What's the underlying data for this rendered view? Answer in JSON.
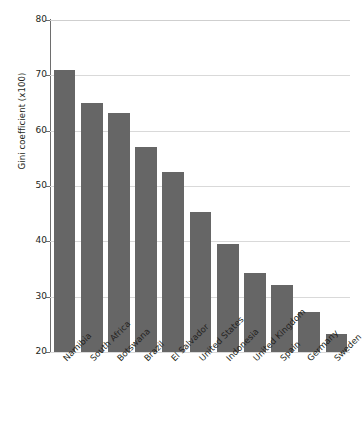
{
  "chart_data": {
    "type": "bar",
    "title": "",
    "xlabel": "",
    "ylabel": "Gini coefficient (x100)",
    "ylim": [
      20,
      80
    ],
    "yticks": [
      20,
      30,
      40,
      50,
      60,
      70,
      80
    ],
    "ytick_labels": [
      "20",
      "30",
      "40",
      "50",
      "60",
      "70",
      "80"
    ],
    "grid": "horizontal",
    "legend": "none",
    "bar_color": "#666666",
    "gridline_color": "#d9d9d9",
    "axis_color": "#6e6e6e",
    "categories": [
      "Namibia",
      "South Africa",
      "Botswana",
      "Brazil",
      "El Salvador",
      "United States",
      "Indonesia",
      "United Kingdom",
      "Spain",
      "Germany",
      "Sweden"
    ],
    "values": [
      70.9,
      65.0,
      63.2,
      57.0,
      52.6,
      45.3,
      39.6,
      34.3,
      32.2,
      27.2,
      23.2
    ]
  }
}
